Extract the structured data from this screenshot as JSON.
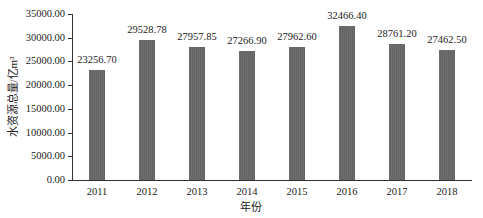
{
  "chart_data": {
    "type": "bar",
    "title": "",
    "xlabel": "年份",
    "ylabel": "水资源总量/亿m³",
    "categories": [
      "2011",
      "2012",
      "2013",
      "2014",
      "2015",
      "2016",
      "2017",
      "2018"
    ],
    "values": [
      23256.7,
      29528.78,
      27957.85,
      27266.9,
      27962.6,
      32466.4,
      28761.2,
      27462.5
    ],
    "value_labels": [
      "23256.70",
      "29528.78",
      "27957.85",
      "27266.90",
      "27962.60",
      "32466.40",
      "28761.20",
      "27462.50"
    ],
    "ylim": [
      0,
      35000
    ],
    "yticks": [
      0,
      5000,
      10000,
      15000,
      20000,
      25000,
      30000,
      35000
    ],
    "ytick_labels": [
      "0.00",
      "5000.00",
      "10000.00",
      "15000.00",
      "20000.00",
      "25000.00",
      "30000.00",
      "35000.00"
    ],
    "grid": false,
    "legend": null,
    "bar_color": "#6b6b6b"
  }
}
